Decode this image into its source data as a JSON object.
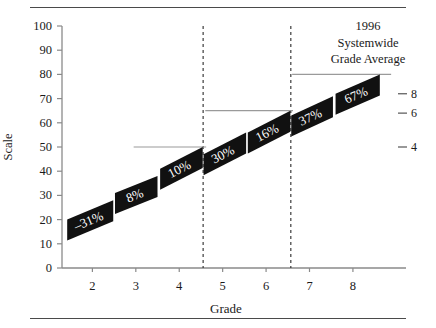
{
  "annotation": {
    "line1": "1996",
    "line2": "Systemwide",
    "line3": "Grade Average"
  },
  "axes": {
    "y_title": "Scale",
    "x_title": "Grade"
  },
  "chart_data": {
    "type": "bar",
    "title": "",
    "subtitle": "",
    "xlabel": "Grade",
    "ylabel": "Scale",
    "xlim": [
      1.3,
      8.9
    ],
    "ylim": [
      0,
      100
    ],
    "grid": false,
    "legend_position": "none",
    "xticks": [
      2,
      3,
      4,
      5,
      6,
      7,
      8
    ],
    "xtick_labels": [
      "2",
      "3",
      "4",
      "5",
      "6",
      "7",
      "8"
    ],
    "yticks": [
      0,
      10,
      20,
      30,
      40,
      50,
      60,
      70,
      80,
      90,
      100
    ],
    "ytick_labels": [
      "0",
      "10",
      "20",
      "30",
      "40",
      "50",
      "60",
      "70",
      "80",
      "90",
      "100"
    ],
    "right_axis": {
      "ticks": [
        8,
        6,
        4
      ],
      "tick_labels": [
        "8",
        "6",
        "4"
      ],
      "tick_scale_values": [
        72,
        64,
        50
      ]
    },
    "categories": [
      "2",
      "3",
      "4",
      "5",
      "6",
      "7",
      "8"
    ],
    "values": [
      -31,
      8,
      10,
      30,
      16,
      37,
      67
    ],
    "data_labels": [
      "–31%",
      "8%",
      "10%",
      "30%",
      "16%",
      "37%",
      "67%"
    ],
    "bars": [
      {
        "grade": "2",
        "label": "–31%",
        "x_left": 1.42,
        "x_right": 2.48,
        "y_left": 20,
        "y_right": 28
      },
      {
        "grade": "3",
        "label": "8%",
        "x_left": 2.52,
        "x_right": 3.5,
        "y_left": 31,
        "y_right": 38
      },
      {
        "grade": "4",
        "label": "10%",
        "x_left": 3.56,
        "x_right": 4.54,
        "y_left": 41,
        "y_right": 50
      },
      {
        "grade": "5",
        "label": "30%",
        "x_left": 4.56,
        "x_right": 5.54,
        "y_left": 47,
        "y_right": 56
      },
      {
        "grade": "6",
        "label": "16%",
        "x_left": 5.58,
        "x_right": 6.56,
        "y_left": 56,
        "y_right": 65
      },
      {
        "grade": "7",
        "label": "37%",
        "x_left": 6.58,
        "x_right": 7.54,
        "y_left": 63,
        "y_right": 71
      },
      {
        "grade": "8",
        "label": "67%",
        "x_left": 7.6,
        "x_right": 8.62,
        "y_left": 72,
        "y_right": 80
      }
    ],
    "reference_lines": [
      {
        "y": 50,
        "x_start": 2.95,
        "x_end": 4.62
      },
      {
        "y": 65,
        "x_start": 4.6,
        "x_end": 6.62
      },
      {
        "y": 80,
        "x_start": 6.6,
        "x_end": 8.88
      }
    ],
    "divider_lines": [
      {
        "x": 4.55,
        "style": "dashed"
      },
      {
        "x": 6.57,
        "style": "dashed"
      }
    ],
    "annotations": [
      {
        "text": "1996 Systemwide Grade Average",
        "position": "top-right"
      }
    ]
  },
  "colors": {
    "bar_fill": "#111111",
    "bar_label": "#ffffff",
    "axis": "#8a8a8a",
    "rule": "#4a4a4a",
    "reference_line": "#9a9a9a",
    "text": "#1a1a1a"
  }
}
